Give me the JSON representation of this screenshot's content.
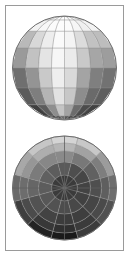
{
  "page": {
    "background_color": "#ffffff",
    "frame": {
      "border_color": "#9a9a9a",
      "border_width_px": 1,
      "fill_color": "#ffffff"
    }
  },
  "chart_data": [
    {
      "id": "globe-lat-lon",
      "type": "heatmap",
      "title": "Sphere shaded in latitude-longitude graticule projection",
      "projection": "orthographic-globe",
      "grid": true,
      "grid_color": "#8c8c8c",
      "outline_color": "#6e6e6e",
      "center": {
        "cx": 58.5,
        "cy": 60
      },
      "radius": 52,
      "xlabel": "longitude",
      "ylabel": "latitude",
      "longitude_bands": 8,
      "latitude_bands": 8,
      "longitude_ticks": [
        "-180",
        "-135",
        "-90",
        "-45",
        "0",
        "45",
        "90",
        "135",
        "180"
      ],
      "latitude_ticks": [
        "90",
        "67.5",
        "45",
        "22.5",
        "0",
        "-22.5",
        "-45",
        "-67.5",
        "-90"
      ],
      "colormap": "grayscale",
      "value_range": [
        0,
        1
      ],
      "cells": [
        {
          "lat_index": 0,
          "values": [
            "#fdfdfd",
            "#fbfbfb",
            "#fcfcfc",
            "#fefefe",
            "#fdfdfd",
            "#fafafa",
            "#fbfbfb",
            "#fcfcfc"
          ]
        },
        {
          "lat_index": 1,
          "values": [
            "#f2f2f2",
            "#f7f7f7",
            "#fbfbfb",
            "#fdfdfd",
            "#fcfcfc",
            "#f6f6f6",
            "#f0f0f0",
            "#f3f3f3"
          ]
        },
        {
          "lat_index": 2,
          "values": [
            "#b9b9b9",
            "#d8d8d8",
            "#ededed",
            "#fafafa",
            "#f4f4f4",
            "#dcdcdc",
            "#c2c2c2",
            "#bdbdbd"
          ]
        },
        {
          "lat_index": 3,
          "values": [
            "#9a9a9a",
            "#c2c2c2",
            "#e4e4e4",
            "#f6f6f6",
            "#ebebeb",
            "#c9c9c9",
            "#a6a6a6",
            "#9d9d9d"
          ]
        },
        {
          "lat_index": 4,
          "values": [
            "#6f6f6f",
            "#949494",
            "#c9c9c9",
            "#eeeeee",
            "#d9d9d9",
            "#a4a4a4",
            "#7f7f7f",
            "#727272"
          ]
        },
        {
          "lat_index": 5,
          "values": [
            "#5b5b5b",
            "#7e7e7e",
            "#b4b4b4",
            "#e2e2e2",
            "#c7c7c7",
            "#8d8d8d",
            "#6a6a6a",
            "#5e5e5e"
          ]
        },
        {
          "lat_index": 6,
          "values": [
            "#3f3f3f",
            "#5c5c5c",
            "#8e8e8e",
            "#c4c4c4",
            "#a3a3a3",
            "#6c6c6c",
            "#4c4c4c",
            "#424242"
          ]
        },
        {
          "lat_index": 7,
          "values": [
            "#1e1e1e",
            "#2c2c2c",
            "#4a4a4a",
            "#6d6d6d",
            "#585858",
            "#3a3a3a",
            "#262626",
            "#1c1c1c"
          ]
        }
      ]
    },
    {
      "id": "polar-azimuthal",
      "type": "heatmap",
      "title": "Sphere shaded in polar azimuthal projection",
      "projection": "polar-azimuthal",
      "grid": true,
      "grid_color": "#8c8c8c",
      "outline_color": "#6e6e6e",
      "center": {
        "cx": 58.5,
        "cy": 60
      },
      "radius": 52,
      "xlabel": "azimuth",
      "ylabel": "radius",
      "sectors": 12,
      "rings": 4,
      "hub_radius": 13,
      "hub_color": "#3b3b3b",
      "azimuth_ticks": [
        "0",
        "30",
        "60",
        "90",
        "120",
        "150",
        "180",
        "210",
        "240",
        "270",
        "300",
        "330"
      ],
      "ring_edges_px": [
        13,
        26,
        37,
        45,
        52
      ],
      "colormap": "grayscale",
      "value_range": [
        0,
        1
      ],
      "ring_values": [
        {
          "ring_index": 0,
          "values": [
            "#5a5a5a",
            "#4e4e4e",
            "#464646",
            "#434343",
            "#414141",
            "#484848",
            "#4d4d4d",
            "#525252",
            "#575757",
            "#5c5c5c",
            "#606060",
            "#5d5d5d"
          ]
        },
        {
          "ring_index": 1,
          "values": [
            "#8a8a8a",
            "#787878",
            "#616161",
            "#4f4f4f",
            "#454545",
            "#3e3e3e",
            "#3c3c3c",
            "#434343",
            "#525252",
            "#666666",
            "#7b7b7b",
            "#878787"
          ]
        },
        {
          "ring_index": 2,
          "values": [
            "#b6b6b6",
            "#a2a2a2",
            "#7e7e7e",
            "#5f5f5f",
            "#4a4a4a",
            "#3b3b3b",
            "#303030",
            "#383838",
            "#4b4b4b",
            "#6d6d6d",
            "#969696",
            "#aeaeae"
          ]
        },
        {
          "ring_index": 3,
          "values": [
            "#d4d4d4",
            "#c8c8c8",
            "#9c9c9c",
            "#6e6e6e",
            "#515151",
            "#3c3c3c",
            "#1a1a1a",
            "#232323",
            "#3f3f3f",
            "#6a6a6a",
            "#a8a8a8",
            "#c6c6c6"
          ]
        }
      ]
    }
  ]
}
